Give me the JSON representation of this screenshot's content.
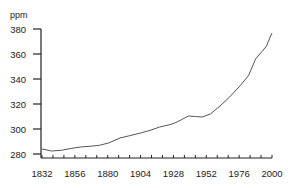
{
  "chart_data": {
    "type": "line",
    "title": "",
    "xlabel": "",
    "ylabel": "ppm",
    "xlim": [
      1832,
      2000
    ],
    "ylim": [
      280,
      380
    ],
    "grid": false,
    "legend": null,
    "x_ticks": [
      1832,
      1856,
      1880,
      1904,
      1928,
      1952,
      1976,
      2000
    ],
    "x_minor_step": 8,
    "y_ticks": [
      280,
      300,
      320,
      340,
      360,
      380
    ],
    "series": [
      {
        "name": "CO2 concentration",
        "color": "#555555",
        "x": [
          1832,
          1839,
          1846,
          1853,
          1860,
          1867,
          1874,
          1881,
          1889,
          1896,
          1904,
          1911,
          1918,
          1925,
          1929,
          1934,
          1939,
          1944,
          1949,
          1955,
          1962,
          1969,
          1977,
          1983,
          1988,
          1993,
          1996,
          1999,
          2000
        ],
        "values": [
          284,
          282.4,
          283,
          284.4,
          285.6,
          286.2,
          287,
          289,
          292.8,
          294.6,
          296.8,
          299,
          301.6,
          303.4,
          304.8,
          307.5,
          310.4,
          310,
          309.6,
          312,
          318.4,
          325.6,
          335,
          343,
          356,
          362.4,
          366.4,
          374.4,
          376.8
        ]
      }
    ]
  },
  "axis": {
    "unit": "ppm",
    "y_labels": [
      "380",
      "360",
      "340",
      "320",
      "300",
      "280"
    ],
    "x_labels": [
      "1832",
      "1856",
      "1880",
      "1904",
      "1928",
      "1952",
      "1976",
      "2000"
    ]
  }
}
